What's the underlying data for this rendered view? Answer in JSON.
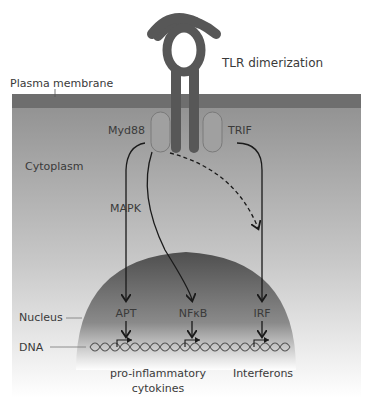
{
  "diagram": {
    "title_label": "TLR dimerization",
    "regions": {
      "plasma_membrane": "Plasma membrane",
      "cytoplasm": "Cytoplasm",
      "nucleus": "Nucleus",
      "dna": "DNA"
    },
    "adaptors": {
      "left": "Myd88",
      "right": "TRIF"
    },
    "pathway_label": "MAPK",
    "transcription_factors": [
      "APT",
      "NFκB",
      "IRF"
    ],
    "outputs": {
      "left_line1": "pro-inflammatory",
      "left_line2": "cytokines",
      "right": "Interferons"
    },
    "colors": {
      "receptor": "#575757",
      "membrane": "#6e6e6e",
      "cytoplasm": "#9a9a9a",
      "nucleus": "#5a5a5a",
      "arrow": "#1a1a1a",
      "text": "#3a3a3a"
    }
  }
}
